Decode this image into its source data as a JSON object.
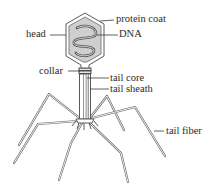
{
  "diagram": {
    "labels": {
      "protein_coat": "protein coat",
      "head": "head",
      "dna": "DNA",
      "collar": "collar",
      "tail_core": "tail core",
      "tail_sheath": "tail sheath",
      "tail_fiber": "tail fiber"
    },
    "colors": {
      "line": "#5a5a5a",
      "head_fill": "#cfcfcf",
      "background": "#ffffff",
      "text": "#2a2a2a"
    }
  }
}
